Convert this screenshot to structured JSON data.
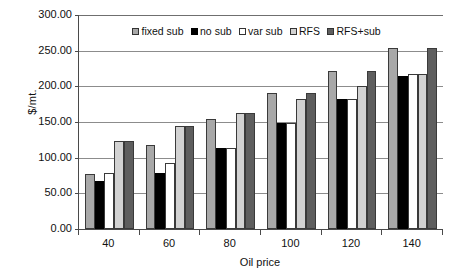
{
  "chart_data": {
    "type": "bar",
    "title": "",
    "xlabel": "Oil price",
    "ylabel": "$/mt.",
    "categories": [
      "40",
      "60",
      "80",
      "100",
      "120",
      "140"
    ],
    "ylim": [
      0,
      300
    ],
    "ytick_labels": [
      "0.00",
      "50.00",
      "100.00",
      "150.00",
      "200.00",
      "250.00",
      "300.00"
    ],
    "ytick_values": [
      0,
      50,
      100,
      150,
      200,
      250,
      300
    ],
    "grid": "horizontal",
    "legend_position": "top-center",
    "series": [
      {
        "name": "fixed sub",
        "color": "#a8a8a8",
        "values": [
          77,
          118,
          154,
          190,
          222,
          254
        ]
      },
      {
        "name": "no sub",
        "color": "#000000",
        "values": [
          67,
          79,
          114,
          149,
          182,
          214
        ]
      },
      {
        "name": "var sub",
        "color": "#ffffff",
        "values": [
          79,
          92,
          114,
          149,
          182,
          218
        ]
      },
      {
        "name": "RFS",
        "color": "#d2d2d2",
        "values": [
          123,
          144,
          163,
          182,
          200,
          218
        ]
      },
      {
        "name": "RFS+sub",
        "color": "#5e5e5e",
        "values": [
          124,
          144,
          163,
          190,
          222,
          254
        ]
      }
    ]
  }
}
